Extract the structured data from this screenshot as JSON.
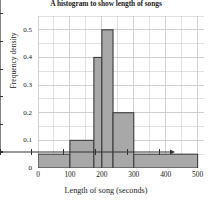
{
  "chart_data": {
    "type": "bar",
    "title": "A histogram to show length of songs",
    "xlabel": "Length of song (seconds)",
    "ylabel": "Frequency density",
    "xlim": [
      0,
      520
    ],
    "ylim": [
      0,
      0.55
    ],
    "grid": true,
    "legend": "none",
    "xticks": [
      "0",
      "100",
      "200",
      "300",
      "400",
      "500"
    ],
    "xtick_values": [
      0,
      100,
      200,
      300,
      400,
      500
    ],
    "yticks": [
      "0",
      "0.1",
      "0.2",
      "0.3",
      "0.4",
      "0.5"
    ],
    "ytick_values": [
      0,
      0.1,
      0.2,
      0.3,
      0.4,
      0.5
    ],
    "bins": [
      {
        "label": "0-100",
        "start": 0,
        "end": 100,
        "value": 0.05
      },
      {
        "label": "100-175",
        "start": 100,
        "end": 175,
        "value": 0.1
      },
      {
        "label": "175-200",
        "start": 175,
        "end": 200,
        "value": 0.4
      },
      {
        "label": "200-235",
        "start": 200,
        "end": 235,
        "value": 0.5
      },
      {
        "label": "235-300",
        "start": 235,
        "end": 300,
        "value": 0.2
      },
      {
        "label": "300-500",
        "start": 300,
        "end": 500,
        "value": 0.05
      }
    ],
    "colors": {
      "bar_fill": "#a8a8a8",
      "bar_edge": "#3c3c3c",
      "grid": "#c9c9c9",
      "axis": "#333333",
      "text": "#1c1c1c"
    }
  }
}
